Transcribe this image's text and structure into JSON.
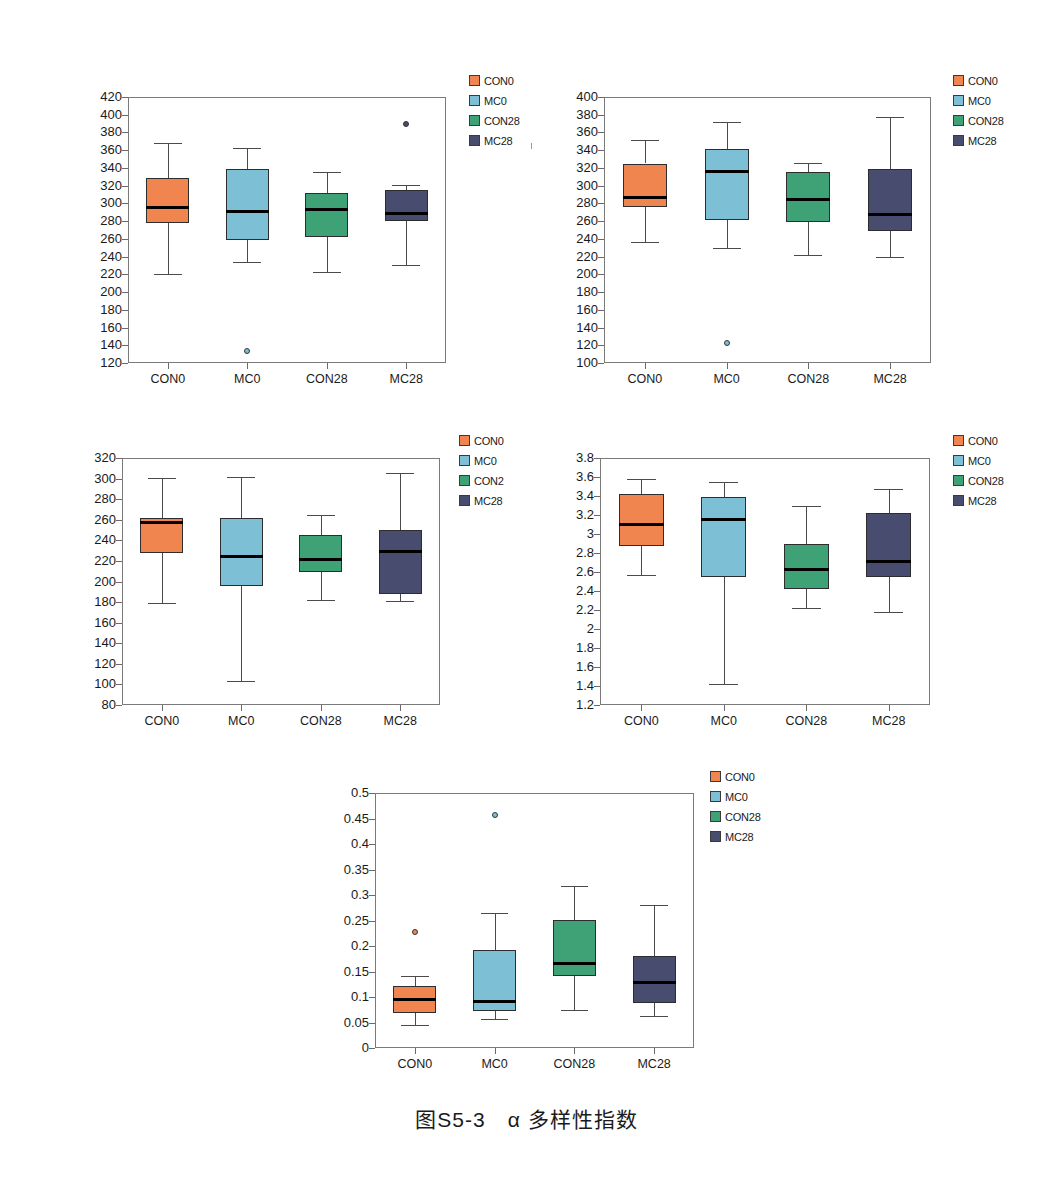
{
  "figure": {
    "caption": "图S5-3　α 多样性指数",
    "groups": [
      "CON0",
      "MC0",
      "CON28",
      "MC28"
    ],
    "colors": {
      "CON0": "#f0854f",
      "MC0": "#7dc0d6",
      "CON28": "#3fa277",
      "MC28": "#484d70"
    }
  },
  "chart_data": [
    {
      "type": "boxplot",
      "title": "p=0.9078",
      "xlabel": "",
      "ylabel": "OTU水平Ace指数",
      "ylim": [
        120,
        420
      ],
      "yticks": [
        120,
        140,
        160,
        180,
        200,
        220,
        240,
        260,
        280,
        300,
        320,
        340,
        360,
        380,
        400,
        420
      ],
      "categories": [
        "CON0",
        "MC0",
        "CON28",
        "MC28"
      ],
      "legend": [
        "CON0",
        "MC0",
        "CON28",
        "MC28"
      ],
      "legend_position": "right",
      "grid": false,
      "boxes": [
        {
          "name": "CON0",
          "whisker_low": 220,
          "q1": 278,
          "median": 295,
          "q3": 329,
          "whisker_high": 368,
          "outliers": []
        },
        {
          "name": "MC0",
          "whisker_low": 234,
          "q1": 259,
          "median": 291,
          "q3": 339,
          "whisker_high": 363,
          "outliers": [
            133
          ]
        },
        {
          "name": "CON28",
          "whisker_low": 223,
          "q1": 262,
          "median": 293,
          "q3": 312,
          "whisker_high": 335,
          "outliers": []
        },
        {
          "name": "MC28",
          "whisker_low": 231,
          "q1": 280,
          "median": 289,
          "q3": 315,
          "whisker_high": 321,
          "outliers": [
            389
          ]
        }
      ]
    },
    {
      "type": "boxplot",
      "title": "p=0.954",
      "xlabel": "",
      "ylabel": "OTU水平Chao指数",
      "ylim": [
        100,
        400
      ],
      "yticks": [
        100,
        120,
        140,
        160,
        180,
        200,
        220,
        240,
        260,
        280,
        300,
        320,
        340,
        360,
        380,
        400
      ],
      "categories": [
        "CON0",
        "MC0",
        "CON28",
        "MC28"
      ],
      "legend": [
        "CON0",
        "MC0",
        "CON28",
        "MC28"
      ],
      "legend_position": "right",
      "grid": false,
      "boxes": [
        {
          "name": "CON0",
          "whisker_low": 236,
          "q1": 276,
          "median": 287,
          "q3": 325,
          "whisker_high": 352,
          "outliers": []
        },
        {
          "name": "MC0",
          "whisker_low": 230,
          "q1": 261,
          "median": 316,
          "q3": 341,
          "whisker_high": 372,
          "outliers": [
            123
          ]
        },
        {
          "name": "CON28",
          "whisker_low": 222,
          "q1": 259,
          "median": 284,
          "q3": 315,
          "whisker_high": 326,
          "outliers": []
        },
        {
          "name": "MC28",
          "whisker_low": 220,
          "q1": 249,
          "median": 267,
          "q3": 319,
          "whisker_high": 378,
          "outliers": []
        }
      ]
    },
    {
      "type": "boxplot",
      "title": "p=0.7788",
      "xlabel": "",
      "ylabel": "OTU水平Sobs指数",
      "ylim": [
        80,
        320
      ],
      "yticks": [
        80,
        100,
        120,
        140,
        160,
        180,
        200,
        220,
        240,
        260,
        280,
        300,
        320
      ],
      "categories": [
        "CON0",
        "MC0",
        "CON28",
        "MC28"
      ],
      "legend": [
        "CON0",
        "MC0",
        "CON2",
        "MC28"
      ],
      "legend_position": "right",
      "grid": false,
      "boxes": [
        {
          "name": "CON0",
          "whisker_low": 179,
          "q1": 228,
          "median": 257,
          "q3": 262,
          "whisker_high": 301,
          "outliers": []
        },
        {
          "name": "MC0",
          "whisker_low": 103,
          "q1": 196,
          "median": 224,
          "q3": 262,
          "whisker_high": 302,
          "outliers": []
        },
        {
          "name": "CON28",
          "whisker_low": 182,
          "q1": 209,
          "median": 221,
          "q3": 245,
          "whisker_high": 265,
          "outliers": []
        },
        {
          "name": "MC28",
          "whisker_low": 181,
          "q1": 188,
          "median": 229,
          "q3": 250,
          "whisker_high": 305,
          "outliers": []
        }
      ]
    },
    {
      "type": "boxplot",
      "title": "p=0.3237",
      "xlabel": "",
      "ylabel": "OTU水平Shannon指数",
      "ylim": [
        1.2,
        3.8
      ],
      "yticks": [
        1.2,
        1.4,
        1.6,
        1.8,
        2,
        2.2,
        2.4,
        2.6,
        2.8,
        3,
        3.2,
        3.4,
        3.6,
        3.8
      ],
      "categories": [
        "CON0",
        "MC0",
        "CON28",
        "MC28"
      ],
      "legend": [
        "CON0",
        "MC0",
        "CON28",
        "MC28"
      ],
      "legend_position": "right",
      "grid": false,
      "boxes": [
        {
          "name": "CON0",
          "whisker_low": 2.57,
          "q1": 2.87,
          "median": 3.1,
          "q3": 3.42,
          "whisker_high": 3.58,
          "outliers": []
        },
        {
          "name": "MC0",
          "whisker_low": 1.42,
          "q1": 2.55,
          "median": 3.15,
          "q3": 3.39,
          "whisker_high": 3.55,
          "outliers": []
        },
        {
          "name": "CON28",
          "whisker_low": 2.22,
          "q1": 2.42,
          "median": 2.63,
          "q3": 2.89,
          "whisker_high": 3.29,
          "outliers": []
        },
        {
          "name": "MC28",
          "whisker_low": 2.18,
          "q1": 2.55,
          "median": 2.71,
          "q3": 3.22,
          "whisker_high": 3.47,
          "outliers": []
        }
      ]
    },
    {
      "type": "boxplot",
      "title": "p=0.2319",
      "xlabel": "",
      "ylabel": "OTU水平Simpson指数",
      "ylim": [
        0,
        0.5
      ],
      "yticks": [
        0,
        0.05,
        0.1,
        0.15,
        0.2,
        0.25,
        0.3,
        0.35,
        0.4,
        0.45,
        0.5
      ],
      "categories": [
        "CON0",
        "MC0",
        "CON28",
        "MC28"
      ],
      "legend": [
        "CON0",
        "MC0",
        "CON28",
        "MC28"
      ],
      "legend_position": "right",
      "grid": false,
      "boxes": [
        {
          "name": "CON0",
          "whisker_low": 0.045,
          "q1": 0.068,
          "median": 0.096,
          "q3": 0.121,
          "whisker_high": 0.141,
          "outliers": [
            0.227
          ]
        },
        {
          "name": "MC0",
          "whisker_low": 0.056,
          "q1": 0.073,
          "median": 0.091,
          "q3": 0.192,
          "whisker_high": 0.265,
          "outliers": [
            0.456
          ]
        },
        {
          "name": "CON28",
          "whisker_low": 0.075,
          "q1": 0.141,
          "median": 0.166,
          "q3": 0.251,
          "whisker_high": 0.317,
          "outliers": []
        },
        {
          "name": "MC28",
          "whisker_low": 0.062,
          "q1": 0.089,
          "median": 0.129,
          "q3": 0.181,
          "whisker_high": 0.281,
          "outliers": []
        }
      ]
    }
  ]
}
